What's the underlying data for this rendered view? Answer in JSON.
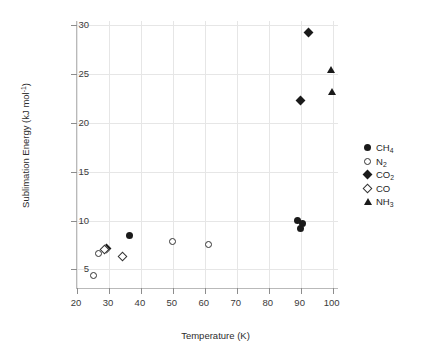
{
  "chart_data": {
    "type": "scatter",
    "title": "",
    "xlabel": "Temperature (K)",
    "ylabel": "Sublimation Energy (kJ mol⁻¹)",
    "ylabel_main": "Sublimation Energy (kJ mol",
    "ylabel_sup": "-1",
    "ylabel_tail": ")",
    "xlim": [
      20,
      102
    ],
    "ylim": [
      3.0,
      30.4
    ],
    "xticks": [
      20,
      30,
      40,
      50,
      60,
      70,
      80,
      90,
      100
    ],
    "yticks": [
      5,
      10,
      15,
      20,
      25,
      30
    ],
    "xtick_labels": [
      "20",
      "30",
      "40",
      "50",
      "60",
      "70",
      "80",
      "90",
      "100"
    ],
    "ytick_labels": [
      "5",
      "10",
      "15",
      "20",
      "25",
      "30"
    ],
    "grid": true,
    "grid_color": "#e6e6e6",
    "legend_position": "right",
    "marker_color": "#1a1a1a",
    "series": [
      {
        "name": "CH4",
        "label": "CH",
        "label_sub": "4",
        "marker": "circle-filled",
        "points": [
          {
            "x": 36.5,
            "y": 8.5
          },
          {
            "x": 89.0,
            "y": 10.0
          },
          {
            "x": 90.0,
            "y": 9.2
          },
          {
            "x": 90.6,
            "y": 9.7
          }
        ]
      },
      {
        "name": "N2",
        "label": "N",
        "label_sub": "2",
        "marker": "circle-open",
        "points": [
          {
            "x": 25.1,
            "y": 4.4
          },
          {
            "x": 26.6,
            "y": 6.6
          },
          {
            "x": 50.0,
            "y": 7.9
          },
          {
            "x": 61.0,
            "y": 7.6
          }
        ]
      },
      {
        "name": "CO2",
        "label": "CO",
        "label_sub": "2",
        "marker": "diamond-filled",
        "points": [
          {
            "x": 29.2,
            "y": 7.1
          },
          {
            "x": 89.9,
            "y": 22.3
          },
          {
            "x": 92.4,
            "y": 29.2
          }
        ]
      },
      {
        "name": "CO",
        "label": "CO",
        "label_sub": "",
        "marker": "diamond-open",
        "points": [
          {
            "x": 28.6,
            "y": 7.0
          },
          {
            "x": 34.2,
            "y": 6.3
          }
        ]
      },
      {
        "name": "NH3",
        "label": "NH",
        "label_sub": "3",
        "marker": "triangle-filled",
        "points": [
          {
            "x": 99.6,
            "y": 25.4
          },
          {
            "x": 99.9,
            "y": 23.1
          }
        ]
      }
    ]
  }
}
